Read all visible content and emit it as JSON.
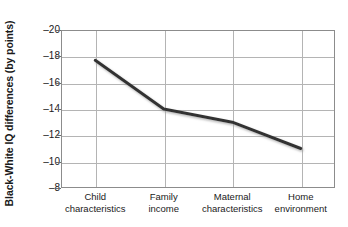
{
  "chart_data": {
    "type": "line",
    "title": "",
    "xlabel": "",
    "ylabel": "Black-White IQ differences (by points)",
    "categories": [
      "Child characteristics",
      "Family income",
      "Maternal characteristics",
      "Home environment"
    ],
    "category_lines": [
      [
        "Child",
        "characteristics"
      ],
      [
        "Family",
        "income"
      ],
      [
        "Maternal",
        "characteristics"
      ],
      [
        "Home",
        "environment"
      ]
    ],
    "values": [
      -17.7,
      -14.0,
      -13.0,
      -11.0
    ],
    "ylim": [
      -20,
      -8
    ],
    "yticks": [
      -20,
      -18,
      -16,
      -14,
      -12,
      -10,
      -8
    ],
    "ytick_labels": [
      "–20",
      "–18",
      "–16",
      "–14",
      "–12",
      "–10",
      "–8"
    ],
    "grid": true,
    "legend": null,
    "series": [
      {
        "name": "Black-White IQ difference",
        "values": [
          -17.7,
          -14.0,
          -13.0,
          -11.0
        ]
      }
    ],
    "colors": {
      "line": "#333333",
      "grid": "#b4b4b4",
      "frame": "#8c8c8c",
      "text": "#1a1a1a",
      "background": "#ffffff"
    }
  }
}
